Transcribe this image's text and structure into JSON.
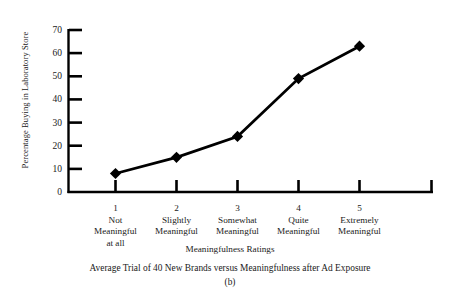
{
  "chart_data": {
    "type": "line",
    "title": "",
    "caption": "Average Trial of 40 New Brands versus Meaningfulness after Ad Exposure",
    "subcaption": "(b)",
    "xlabel": "Meaningfulness Ratings",
    "ylabel": "Percentage Buying in Laboratory Store",
    "categories": [
      "1",
      "2",
      "3",
      "4",
      "5"
    ],
    "category_labels": [
      [
        "Not",
        "Meaningful",
        "at all"
      ],
      [
        "Slightly",
        "Meaningful",
        ""
      ],
      [
        "Somewhat",
        "Meaningful",
        ""
      ],
      [
        "Quite",
        "Meaningful",
        ""
      ],
      [
        "Extremely",
        "Meaningful",
        ""
      ]
    ],
    "values": [
      8,
      15,
      24,
      49,
      63
    ],
    "ylim": [
      0,
      70
    ],
    "yticks": [
      0,
      10,
      20,
      30,
      40,
      50,
      60,
      70
    ],
    "ytick_labels": [
      "0",
      "10",
      "20",
      "30",
      "40",
      "50",
      "60",
      "70"
    ],
    "grid": false,
    "legend": false,
    "marker": "diamond",
    "line_color": "#000000",
    "marker_color": "#000000",
    "axis_color": "#000000"
  }
}
